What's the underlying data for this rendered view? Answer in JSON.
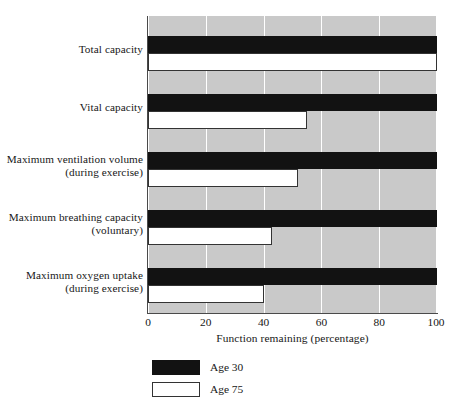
{
  "chart_data": {
    "type": "bar",
    "orientation": "horizontal",
    "title": "",
    "xlabel": "Function remaining (percentage)",
    "ylabel": "",
    "xlim": [
      0,
      100
    ],
    "xticks": [
      0,
      20,
      40,
      60,
      80,
      100
    ],
    "grid": true,
    "grid_axis": "x",
    "legend_position": "below-left",
    "categories": [
      "Total capacity",
      "Vital capacity",
      "Maximum ventilation volume (during exercise)",
      "Maximum breathing capacity (voluntary)",
      "Maximum oxygen uptake (during exercise)"
    ],
    "category_lines": [
      [
        "Total capacity",
        ""
      ],
      [
        "Vital capacity",
        ""
      ],
      [
        "Maximum ventilation volume",
        "(during exercise)"
      ],
      [
        "Maximum breathing capacity",
        "(voluntary)"
      ],
      [
        "Maximum oxygen uptake",
        "(during exercise)"
      ]
    ],
    "series": [
      {
        "name": "Age 30",
        "color": "#121212",
        "values": [
          100,
          100,
          100,
          100,
          100
        ]
      },
      {
        "name": "Age 75",
        "color": "#ffffff",
        "values": [
          100,
          55,
          52,
          43,
          40
        ]
      }
    ],
    "colors": {
      "plot_background": "#c9c9c9",
      "gridline": "#ffffff",
      "axis": "#4a4a4a",
      "age30": "#121212",
      "age75": "#ffffff",
      "text": "#171717"
    }
  },
  "xticks_labels": [
    "0",
    "20",
    "40",
    "60",
    "80",
    "100"
  ],
  "axis": {
    "x_title": "Function remaining (percentage)"
  },
  "categories_display": [
    {
      "line1": "Total capacity",
      "line2": ""
    },
    {
      "line1": "Vital capacity",
      "line2": ""
    },
    {
      "line1": "Maximum ventilation volume",
      "line2": "(during exercise)"
    },
    {
      "line1": "Maximum breathing capacity",
      "line2": "(voluntary)"
    },
    {
      "line1": "Maximum oxygen uptake",
      "line2": "(during exercise)"
    }
  ],
  "legend": {
    "items": [
      {
        "label": "Age 30",
        "swatch": "black"
      },
      {
        "label": "Age 75",
        "swatch": "white"
      }
    ]
  }
}
